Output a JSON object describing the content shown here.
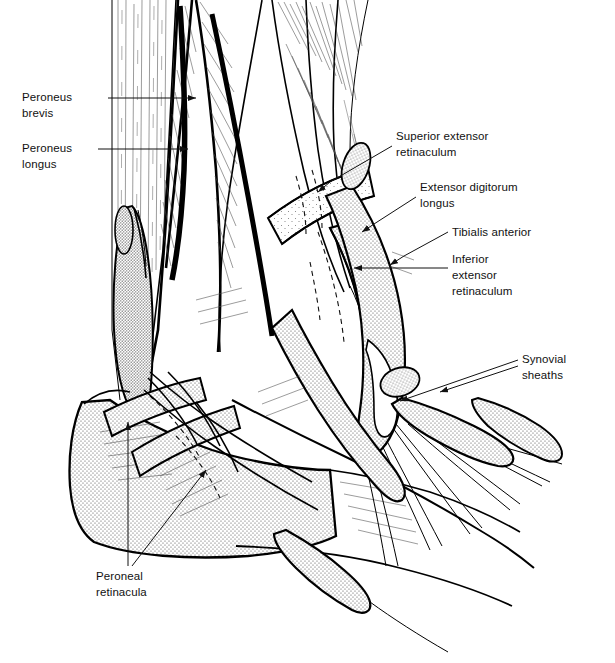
{
  "figure": {
    "background_color": "#ffffff",
    "line_color": "#000000",
    "stipple_color": "#4a4a4a"
  },
  "labels": [
    {
      "id": "peroneus-brevis",
      "text_lines": [
        "Peroneus",
        "brevis"
      ],
      "text_x": 22,
      "text_y": 101,
      "align": "start",
      "leaders": [
        {
          "points": "108,98 196,98",
          "arrow": "right",
          "arrow_at": "196,98"
        }
      ]
    },
    {
      "id": "peroneus-longus",
      "text_lines": [
        "Peroneus",
        "longus"
      ],
      "text_x": 22,
      "text_y": 152,
      "align": "start",
      "leaders": [
        {
          "points": "98,149 188,149",
          "arrow": "right",
          "arrow_at": "188,149"
        }
      ]
    },
    {
      "id": "superior-extensor-retinaculum",
      "text_lines": [
        "Superior extensor",
        "retinaculum"
      ],
      "text_x": 396,
      "text_y": 140,
      "align": "start",
      "leaders": [
        {
          "points": "392,146 330,180 320,193",
          "arrow": "left-down",
          "arrow_at": "320,193"
        }
      ]
    },
    {
      "id": "extensor-digitorum-longus",
      "text_lines": [
        "Extensor digitorum",
        "longus"
      ],
      "text_x": 420,
      "text_y": 191,
      "align": "start",
      "leaders": [
        {
          "points": "416,197 372,225 362,233",
          "arrow": "left-down",
          "arrow_at": "362,233"
        }
      ]
    },
    {
      "id": "tibialis-anterior",
      "text_lines": [
        "Tibialis anterior"
      ],
      "text_x": 452,
      "text_y": 236,
      "align": "start",
      "leaders": [
        {
          "points": "448,232 402,258 390,266",
          "arrow": "left-down",
          "arrow_at": "390,266"
        }
      ]
    },
    {
      "id": "inferior-extensor-retinaculum",
      "text_lines": [
        "Inferior",
        "extensor",
        "retinaculum"
      ],
      "text_x": 452,
      "text_y": 263,
      "align": "start",
      "leaders": [
        {
          "points": "448,268 352,268",
          "arrow": "left",
          "arrow_at": "352,268"
        }
      ]
    },
    {
      "id": "synovial-sheaths",
      "text_lines": [
        "Synovial",
        "sheaths"
      ],
      "text_x": 522,
      "text_y": 363,
      "align": "start",
      "leaders": [
        {
          "points": "518,360 398,402",
          "arrow": "left-down",
          "arrow_at": "398,402"
        },
        {
          "points": "518,368 438,392",
          "arrow": "left-down",
          "arrow_at": "438,392"
        }
      ]
    },
    {
      "id": "peroneal-retinacula",
      "text_lines": [
        "Peroneal",
        "retinacula"
      ],
      "text_x": 96,
      "text_y": 580,
      "align": "start",
      "leaders": [
        {
          "points": "128,566 128,420",
          "arrow": "up",
          "arrow_at": "128,420"
        },
        {
          "points": "132,566 208,468",
          "arrow": "up-right",
          "arrow_at": "208,468"
        }
      ]
    }
  ],
  "structures": [
    {
      "name": "leg-shaft",
      "kind": "muscle-hatched"
    },
    {
      "name": "peroneus-longus-muscle",
      "kind": "muscle-hatched"
    },
    {
      "name": "peroneus-brevis-muscle",
      "kind": "muscle-hatched"
    },
    {
      "name": "lateral-malleolus",
      "kind": "bone-stippled"
    },
    {
      "name": "calcaneus",
      "kind": "bone-stippled"
    },
    {
      "name": "superior-extensor-retinaculum-band",
      "kind": "band-stippled"
    },
    {
      "name": "inferior-extensor-retinaculum-band",
      "kind": "band-stippled"
    },
    {
      "name": "peroneal-retinacula-bands",
      "kind": "band-stippled"
    },
    {
      "name": "extensor-tendons-fan",
      "kind": "tendon-lines"
    },
    {
      "name": "synovial-sheath-dorsal",
      "kind": "sheath-stippled"
    },
    {
      "name": "synovial-sheath-lateral",
      "kind": "sheath-stippled"
    },
    {
      "name": "synovial-sheath-anterior",
      "kind": "sheath-stippled"
    }
  ]
}
